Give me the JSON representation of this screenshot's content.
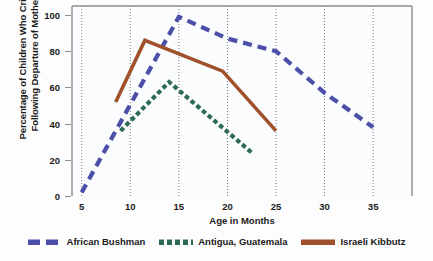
{
  "chart_data": {
    "type": "line",
    "title": "",
    "xlabel": "Age in Months",
    "ylabel": "Percentage of Children Who Cried Following Departure of Mother",
    "ylabel_line1": "Percentage of Children Who Cried",
    "ylabel_line2": "Following Departure of Mother",
    "xlim": [
      4,
      39
    ],
    "ylim": [
      0,
      105
    ],
    "xticks": [
      5,
      10,
      15,
      20,
      25,
      30,
      35
    ],
    "yticks": [
      0,
      20,
      40,
      60,
      80,
      100
    ],
    "xtick_labels": [
      "5",
      "10",
      "15",
      "20",
      "25",
      "30",
      "35"
    ],
    "ytick_labels": [
      "0",
      "20",
      "40",
      "60",
      "80",
      "100"
    ],
    "grid": "vertical-dotted",
    "legend_position": "bottom-center",
    "series": [
      {
        "name": "African Bushman",
        "color": "#4B4FA8",
        "style": "dashed",
        "points": [
          [
            5,
            2
          ],
          [
            15,
            99
          ],
          [
            20,
            87
          ],
          [
            25,
            80
          ],
          [
            30,
            57
          ],
          [
            35,
            38
          ]
        ]
      },
      {
        "name": "Antigua, Guatemala",
        "color": "#2C6B52",
        "style": "dotted",
        "points": [
          [
            9,
            36
          ],
          [
            14,
            63
          ],
          [
            22.5,
            24
          ]
        ]
      },
      {
        "name": "Israeli Kibbutz",
        "color": "#A0502A",
        "style": "solid",
        "points": [
          [
            8.5,
            52
          ],
          [
            11.5,
            86
          ],
          [
            19.5,
            69
          ],
          [
            25,
            36
          ]
        ]
      }
    ]
  },
  "legend": {
    "items": [
      {
        "label": "African Bushman",
        "color": "#4B4FA8",
        "style": "dashed"
      },
      {
        "label": "Antigua, Guatemala",
        "color": "#2C6B52",
        "style": "dotted"
      },
      {
        "label": "Israeli Kibbutz",
        "color": "#A0502A",
        "style": "solid"
      }
    ]
  },
  "axes": {
    "x_title": "Age in Months",
    "y_title_line1": "Percentage of Children Who Cried",
    "y_title_line2": "Following Departure of Mother"
  }
}
